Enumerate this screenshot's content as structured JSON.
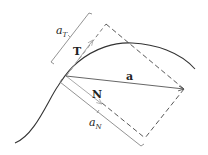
{
  "diagram": {
    "labels": {
      "tangent_vector": "T",
      "normal_vector": "N",
      "acceleration_vector": "a",
      "tangential_component": "a",
      "tangential_component_sub": "T",
      "normal_component": "a",
      "normal_component_sub": "N"
    },
    "colors": {
      "curve": "#333333",
      "acceleration": "#555555",
      "unit_vectors": "#aaaaaa",
      "dashed": "#444444",
      "bracket": "#777777"
    }
  }
}
